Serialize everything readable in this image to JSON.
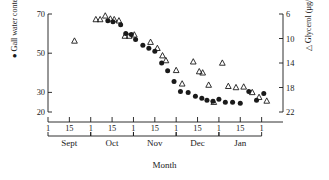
{
  "chart_data": {
    "type": "scatter",
    "title": "",
    "xlabel": "Month",
    "ylabel_left": "● Gall water content (%)",
    "ylabel_right": "△ Glycerol (µg/mg)",
    "left_axis": {
      "label": "Gall water content (%)",
      "marker": "filled-circle",
      "ticks": [
        70,
        50,
        30,
        20
      ],
      "tick_labels": [
        "70",
        "50",
        "30",
        "20"
      ],
      "direction": "normal",
      "ylim": [
        20,
        70
      ]
    },
    "right_axis": {
      "label": "Glycerol (µg/mg)",
      "marker": "open-triangle",
      "ticks": [
        6,
        10,
        14,
        18,
        22
      ],
      "tick_labels": [
        "6",
        "10",
        "14",
        "18",
        "22"
      ],
      "direction": "inverted",
      "ylim": [
        6,
        22
      ]
    },
    "x_axis": {
      "label": "Month",
      "months": [
        "Sept",
        "Oct",
        "Nov",
        "Dec",
        "Jan"
      ],
      "day_tick_labels": [
        "1",
        "15",
        "1",
        "15",
        "1",
        "15",
        "1",
        "15",
        "1",
        "15",
        "1"
      ],
      "grid": false
    },
    "legend": {
      "position": "axis-labels",
      "entries": [
        {
          "marker": "●",
          "name": "Gall water content (%)"
        },
        {
          "marker": "△",
          "name": "Glycerol (µg/mg)"
        }
      ]
    },
    "series": [
      {
        "name": "Gall water content (%)",
        "marker": "filled-circle",
        "axis": "left",
        "points": [
          {
            "x": 1.4,
            "y": 66.5
          },
          {
            "x": 1.52,
            "y": 66.0
          },
          {
            "x": 1.7,
            "y": 64.5
          },
          {
            "x": 1.82,
            "y": 60.0
          },
          {
            "x": 1.95,
            "y": 59.5
          },
          {
            "x": 2.05,
            "y": 57.0
          },
          {
            "x": 2.22,
            "y": 54.0
          },
          {
            "x": 2.36,
            "y": 52.5
          },
          {
            "x": 2.5,
            "y": 51.0
          },
          {
            "x": 2.66,
            "y": 45.0
          },
          {
            "x": 2.8,
            "y": 41.0
          },
          {
            "x": 2.95,
            "y": 35.5
          },
          {
            "x": 3.1,
            "y": 30.5
          },
          {
            "x": 3.28,
            "y": 30.0
          },
          {
            "x": 3.45,
            "y": 28.0
          },
          {
            "x": 3.6,
            "y": 27.0
          },
          {
            "x": 3.72,
            "y": 26.0
          },
          {
            "x": 3.86,
            "y": 25.5
          },
          {
            "x": 4.0,
            "y": 26.5
          },
          {
            "x": 4.15,
            "y": 25.0
          },
          {
            "x": 4.32,
            "y": 25.0
          },
          {
            "x": 4.5,
            "y": 24.5
          },
          {
            "x": 4.7,
            "y": 30.5
          },
          {
            "x": 4.88,
            "y": 26.0
          },
          {
            "x": 5.05,
            "y": 29.5
          }
        ]
      },
      {
        "name": "Glycerol (µg/mg)",
        "marker": "open-triangle",
        "axis": "right",
        "points": [
          {
            "x": 0.62,
            "y": 10.4
          },
          {
            "x": 1.12,
            "y": 6.9
          },
          {
            "x": 1.22,
            "y": 6.9
          },
          {
            "x": 1.34,
            "y": 6.3
          },
          {
            "x": 1.46,
            "y": 6.8
          },
          {
            "x": 1.55,
            "y": 6.9
          },
          {
            "x": 1.66,
            "y": 7.1
          },
          {
            "x": 1.8,
            "y": 9.6
          },
          {
            "x": 1.9,
            "y": 9.6
          },
          {
            "x": 2.02,
            "y": 9.4
          },
          {
            "x": 2.4,
            "y": 10.6
          },
          {
            "x": 2.56,
            "y": 11.6
          },
          {
            "x": 2.68,
            "y": 12.8
          },
          {
            "x": 2.76,
            "y": 13.6
          },
          {
            "x": 3.0,
            "y": 15.2
          },
          {
            "x": 3.14,
            "y": 17.4
          },
          {
            "x": 3.4,
            "y": 13.8
          },
          {
            "x": 3.54,
            "y": 15.4
          },
          {
            "x": 3.62,
            "y": 15.6
          },
          {
            "x": 3.76,
            "y": 17.6
          },
          {
            "x": 3.88,
            "y": 20.4
          },
          {
            "x": 4.08,
            "y": 14.0
          },
          {
            "x": 4.22,
            "y": 17.8
          },
          {
            "x": 4.4,
            "y": 18.0
          },
          {
            "x": 4.58,
            "y": 17.9
          },
          {
            "x": 4.78,
            "y": 18.8
          },
          {
            "x": 4.94,
            "y": 19.6
          },
          {
            "x": 5.12,
            "y": 20.2
          }
        ]
      }
    ]
  }
}
